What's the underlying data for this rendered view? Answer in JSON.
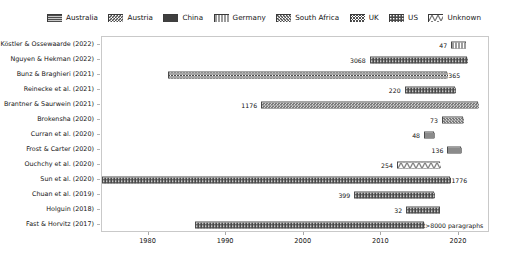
{
  "legend": {
    "position": "top",
    "items": [
      {
        "label": "Australia",
        "pattern": "dense-horizontal",
        "color": "#555555"
      },
      {
        "label": "Austria",
        "pattern": "diagonal-back",
        "color": "#555555"
      },
      {
        "label": "China",
        "pattern": "solid-dark",
        "color": "#444444"
      },
      {
        "label": "Germany",
        "pattern": "vertical-lines",
        "color": "#777777"
      },
      {
        "label": "South Africa",
        "pattern": "diagonal-fwd",
        "color": "#666666"
      },
      {
        "label": "UK",
        "pattern": "cross-hatch",
        "color": "#555555"
      },
      {
        "label": "US",
        "pattern": "dense-dotted",
        "color": "#4a4a4a"
      },
      {
        "label": "Unknown",
        "pattern": "zigzag",
        "color": "#888888"
      }
    ]
  },
  "chart_data": {
    "type": "bar",
    "orientation": "horizontal",
    "title": "",
    "xlabel": "",
    "ylabel": "",
    "xlim": [
      1974,
      2024
    ],
    "xticks": [
      1980,
      1990,
      2000,
      2010,
      2020
    ],
    "xtick_labels": [
      "1980",
      "1990",
      "2000",
      "2010",
      "2020"
    ],
    "grid": false,
    "legend_position": "top",
    "categories": [
      "Köstler & Ossewaarde (2022)",
      "Nguyen & Hekman (2022)",
      "Bunz & Braghieri (2021)",
      "Reinecke et al. (2021)",
      "Brantner & Saurwein (2021)",
      "Brokensha (2020)",
      "Curran et al. (2020)",
      "Frost & Carter (2020)",
      "Ouchchy et al. (2020)",
      "Sun et al. (2020)",
      "Chuan et al. (2019)",
      "Holguin (2018)",
      "Fast & Horvitz (2017)"
    ],
    "bars": [
      {
        "study": "Köstler & Ossewaarde (2022)",
        "start": 2019.0,
        "end": 2020.9,
        "value_label": "47",
        "label_side": "left",
        "country": "Germany",
        "pattern": "vertical-lines"
      },
      {
        "study": "Nguyen & Hekman (2022)",
        "start": 2008.5,
        "end": 2021.0,
        "value_label": "3068",
        "label_side": "left",
        "country": "Unknown",
        "pattern": "dense-dotted"
      },
      {
        "study": "Bunz & Braghieri (2021)",
        "start": 1982.5,
        "end": 2018.5,
        "value_label": "365",
        "label_side": "right",
        "country": "UK",
        "pattern": "cross-hatch"
      },
      {
        "study": "Reinecke et al. (2021)",
        "start": 2013.0,
        "end": 2019.5,
        "value_label": "220",
        "label_side": "left",
        "country": "Germany",
        "pattern": "dense-dotted"
      },
      {
        "study": "Brantner & Saurwein (2021)",
        "start": 1994.5,
        "end": 2022.5,
        "value_label": "1176",
        "label_side": "left",
        "country": "Austria",
        "pattern": "diagonal-back"
      },
      {
        "study": "Brokensha (2020)",
        "start": 2017.8,
        "end": 2020.5,
        "value_label": "73",
        "label_side": "left",
        "country": "South Africa",
        "pattern": "diagonal-fwd"
      },
      {
        "study": "Curran et al. (2020)",
        "start": 2015.5,
        "end": 2016.8,
        "value_label": "48",
        "label_side": "left",
        "country": "Australia",
        "pattern": "dense-horizontal"
      },
      {
        "study": "Frost & Carter (2020)",
        "start": 2018.5,
        "end": 2020.3,
        "value_label": "136",
        "label_side": "left",
        "country": "Australia",
        "pattern": "dense-horizontal"
      },
      {
        "study": "Ouchchy et al. (2020)",
        "start": 2012.0,
        "end": 2017.5,
        "value_label": "254",
        "label_side": "left",
        "country": "Unknown",
        "pattern": "zigzag"
      },
      {
        "study": "Sun et al. (2020)",
        "start": 1974.0,
        "end": 2018.9,
        "value_label": "1776",
        "label_side": "right",
        "country": "China",
        "pattern": "dense-dotted"
      },
      {
        "study": "Chuan et al. (2019)",
        "start": 2006.5,
        "end": 2016.8,
        "value_label": "399",
        "label_side": "left",
        "country": "US",
        "pattern": "dense-dotted"
      },
      {
        "study": "Holguin (2018)",
        "start": 2013.2,
        "end": 2017.5,
        "value_label": "32",
        "label_side": "left",
        "country": "US",
        "pattern": "dense-dotted"
      },
      {
        "study": "Fast & Horvitz (2017)",
        "start": 1986.0,
        "end": 2015.5,
        "value_label": ">8000 paragraphs",
        "label_side": "right",
        "country": "US",
        "pattern": "dense-dotted"
      }
    ]
  }
}
